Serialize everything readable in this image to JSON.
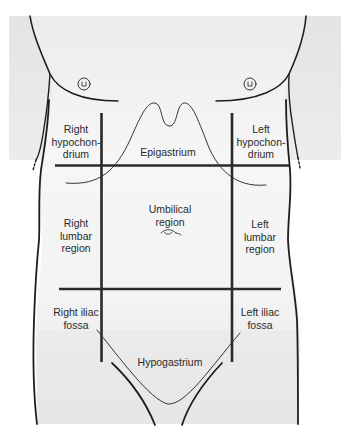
{
  "diagram": {
    "colors": {
      "background_gray": "#e6e6e6",
      "body_fill": "#f4f4f4",
      "line": "#1e1e1e",
      "label_text": "#2a2a2a"
    },
    "regions": {
      "right_hypochondrium": "Right\nhypochon-\ndrium",
      "epigastrium": "Epigastrium",
      "left_hypochondrium": "Left\nhypochon-\ndrium",
      "right_lumbar": "Right\nlumbar\nregion",
      "umbilical": "Umbilical\nregion",
      "left_lumbar": "Left\nlumbar\nregion",
      "right_iliac": "Right iliac\nfossa",
      "hypogastrium": "Hypogastrium",
      "left_iliac": "Left iliac\nfossa"
    }
  }
}
